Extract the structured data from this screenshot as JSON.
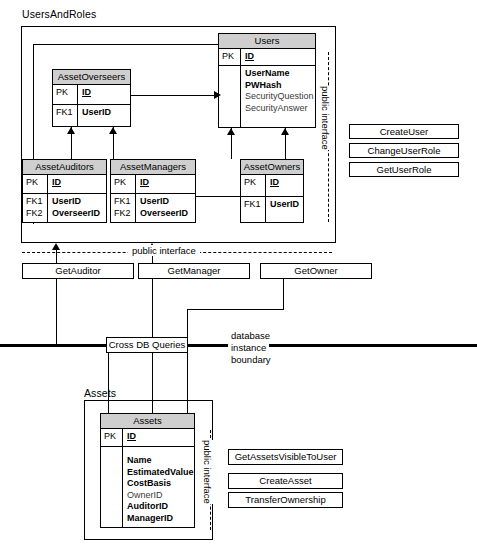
{
  "diagram": {
    "title": "UsersAndRoles",
    "groups": [
      {
        "id": "users_and_roles",
        "label": "UsersAndRoles"
      },
      {
        "id": "assets",
        "label": "Assets"
      }
    ],
    "public_interface_label": "public interface",
    "boundary": {
      "line1": "database",
      "line2": "instance",
      "line3": "boundary",
      "cross_db_label": "Cross DB Queries"
    }
  },
  "tables": {
    "users": {
      "name": "Users",
      "key_rows": [
        {
          "key": "PK",
          "field": "ID",
          "style": "underline"
        }
      ],
      "attr_rows": [
        {
          "key": "",
          "field": "UserName",
          "style": "bold"
        },
        {
          "key": "",
          "field": "PWHash",
          "style": "bold"
        },
        {
          "key": "",
          "field": "SecurityQuestion",
          "style": "normal"
        },
        {
          "key": "",
          "field": "SecurityAnswer",
          "style": "normal"
        }
      ]
    },
    "asset_overseers": {
      "name": "AssetOverseers",
      "key_rows": [
        {
          "key": "PK",
          "field": "ID",
          "style": "underline"
        }
      ],
      "attr_rows": [
        {
          "key": "FK1",
          "field": "UserID",
          "style": "bold"
        }
      ]
    },
    "asset_auditors": {
      "name": "AssetAuditors",
      "key_rows": [
        {
          "key": "PK",
          "field": "ID",
          "style": "underline"
        }
      ],
      "attr_rows": [
        {
          "key": "FK1",
          "field": "UserID",
          "style": "bold"
        },
        {
          "key": "FK2",
          "field": "OverseerID",
          "style": "bold"
        }
      ]
    },
    "asset_managers": {
      "name": "AssetManagers",
      "key_rows": [
        {
          "key": "PK",
          "field": "ID",
          "style": "underline"
        }
      ],
      "attr_rows": [
        {
          "key": "FK1",
          "field": "UserID",
          "style": "bold"
        },
        {
          "key": "FK2",
          "field": "OverseerID",
          "style": "bold"
        }
      ]
    },
    "asset_owners": {
      "name": "AssetOwners",
      "key_rows": [
        {
          "key": "PK",
          "field": "ID",
          "style": "underline"
        }
      ],
      "attr_rows": [
        {
          "key": "FK1",
          "field": "UserID",
          "style": "bold"
        }
      ]
    },
    "assets": {
      "name": "Assets",
      "key_rows": [
        {
          "key": "PK",
          "field": "ID",
          "style": "underline"
        }
      ],
      "attr_rows": [
        {
          "key": "",
          "field": "Name",
          "style": "bold"
        },
        {
          "key": "",
          "field": "EstimatedValue",
          "style": "bold"
        },
        {
          "key": "",
          "field": "CostBasis",
          "style": "bold"
        },
        {
          "key": "",
          "field": "OwnerID",
          "style": "normal"
        },
        {
          "key": "",
          "field": "AuditorID",
          "style": "bold"
        },
        {
          "key": "",
          "field": "ManagerID",
          "style": "bold"
        }
      ]
    }
  },
  "operations": {
    "users_right": [
      {
        "label": "CreateUser"
      },
      {
        "label": "ChangeUserRole"
      },
      {
        "label": "GetUserRole"
      }
    ],
    "users_bottom": [
      {
        "label": "GetAuditor"
      },
      {
        "label": "GetManager"
      },
      {
        "label": "GetOwner"
      }
    ],
    "assets_right": [
      {
        "label": "GetAssetsVisibleToUser"
      },
      {
        "label": "CreateAsset"
      },
      {
        "label": "TransferOwnership"
      }
    ]
  },
  "colors": {
    "header_fill": "#cfcfcf",
    "line": "#000000",
    "background": "#ffffff"
  }
}
